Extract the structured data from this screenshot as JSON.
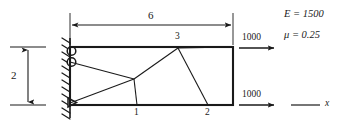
{
  "figure": {
    "stroke_color": "#1a1a1a",
    "background_color": "#ffffff"
  },
  "dimensions": {
    "horizontal": {
      "label": "6",
      "name": "length-dimension"
    },
    "vertical": {
      "label": "2",
      "name": "height-dimension"
    }
  },
  "nodes": [
    {
      "id": "1",
      "label": "1",
      "x": 137,
      "y": 105
    },
    {
      "id": "2",
      "label": "2",
      "x": 208,
      "y": 105
    },
    {
      "id": "3",
      "label": "3",
      "x": 178,
      "y": 48
    }
  ],
  "loads": [
    {
      "label": "1000",
      "name": "top-load",
      "direction": "right"
    },
    {
      "label": "1000",
      "name": "bottom-load",
      "direction": "right"
    }
  ],
  "material": {
    "youngs_modulus": {
      "symbol": "E",
      "equals": "= 1500",
      "text": "E = 1500"
    },
    "poisson_ratio": {
      "symbol": "μ",
      "equals": "= 0.25",
      "text": "μ = 0.25"
    }
  },
  "axis": {
    "x_label": "x"
  },
  "support": {
    "type": "fixed-hatched-wall",
    "roller_count": 2,
    "pin_count": 1
  },
  "geometry": {
    "plate": {
      "x": 70,
      "y": 47,
      "width": 163,
      "height": 58
    },
    "mesh_interior_node": {
      "x": 134,
      "y": 79
    },
    "wall_x": 70,
    "wall_top": 38,
    "wall_bottom": 118
  }
}
